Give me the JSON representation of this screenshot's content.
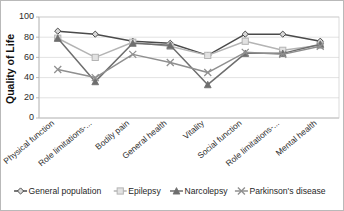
{
  "chart_data": {
    "type": "line",
    "title": "",
    "xlabel": "",
    "ylabel": "Quality of Life",
    "ylim": [
      0,
      100
    ],
    "yticks": [
      0,
      20,
      40,
      60,
      80,
      100
    ],
    "grid": true,
    "legend_position": "bottom",
    "categories": [
      "Physical function",
      "Role limitations-...",
      "Bodily pain",
      "General health",
      "Vitality",
      "Social function",
      "Role limitations-...",
      "Mental health"
    ],
    "series": [
      {
        "name": "General population",
        "marker": "diamond",
        "color": "#4a4a4a",
        "values": [
          86,
          83,
          76,
          74,
          62,
          83,
          83,
          76
        ]
      },
      {
        "name": "Epilepsy",
        "marker": "square",
        "color": "#b4b4b4",
        "values": [
          79,
          60,
          75,
          71,
          62,
          76,
          67,
          72
        ]
      },
      {
        "name": "Narcolepsy",
        "marker": "triangle",
        "color": "#6e6e6e",
        "values": [
          79,
          36,
          74,
          72,
          33,
          64,
          64,
          73
        ]
      },
      {
        "name": "Parkinson's disease",
        "marker": "cross",
        "color": "#8f8f8f",
        "values": [
          48,
          40,
          63,
          55,
          45,
          65,
          63,
          71
        ]
      }
    ]
  },
  "axis": {
    "y_label": "Quality of Life",
    "y_tick_0": "0",
    "y_tick_20": "20",
    "y_tick_40": "40",
    "y_tick_60": "60",
    "y_tick_80": "80",
    "y_tick_100": "100"
  },
  "legend": {
    "items": [
      {
        "label": "General population",
        "marker": "diamond",
        "color": "#4a4a4a"
      },
      {
        "label": "Epilepsy",
        "marker": "square",
        "color": "#b4b4b4"
      },
      {
        "label": "Narcolepsy",
        "marker": "triangle",
        "color": "#6e6e6e"
      },
      {
        "label": "Parkinson's disease",
        "marker": "cross",
        "color": "#8f8f8f"
      }
    ]
  }
}
